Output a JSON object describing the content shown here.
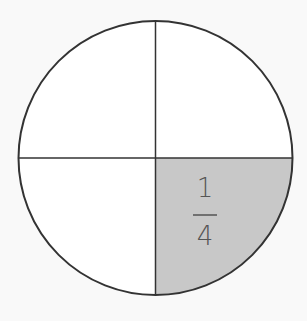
{
  "diagram": {
    "type": "fraction-circle",
    "parts": 4,
    "shaded_parts": 1,
    "shaded_quadrant": "bottom-right",
    "label": {
      "numerator": "1",
      "denominator": "4"
    },
    "colors": {
      "background": "#f9f9f9",
      "circle_fill": "#ffffff",
      "shaded_fill": "#c8c8c8",
      "stroke": "#333333",
      "label": "#555555"
    }
  }
}
